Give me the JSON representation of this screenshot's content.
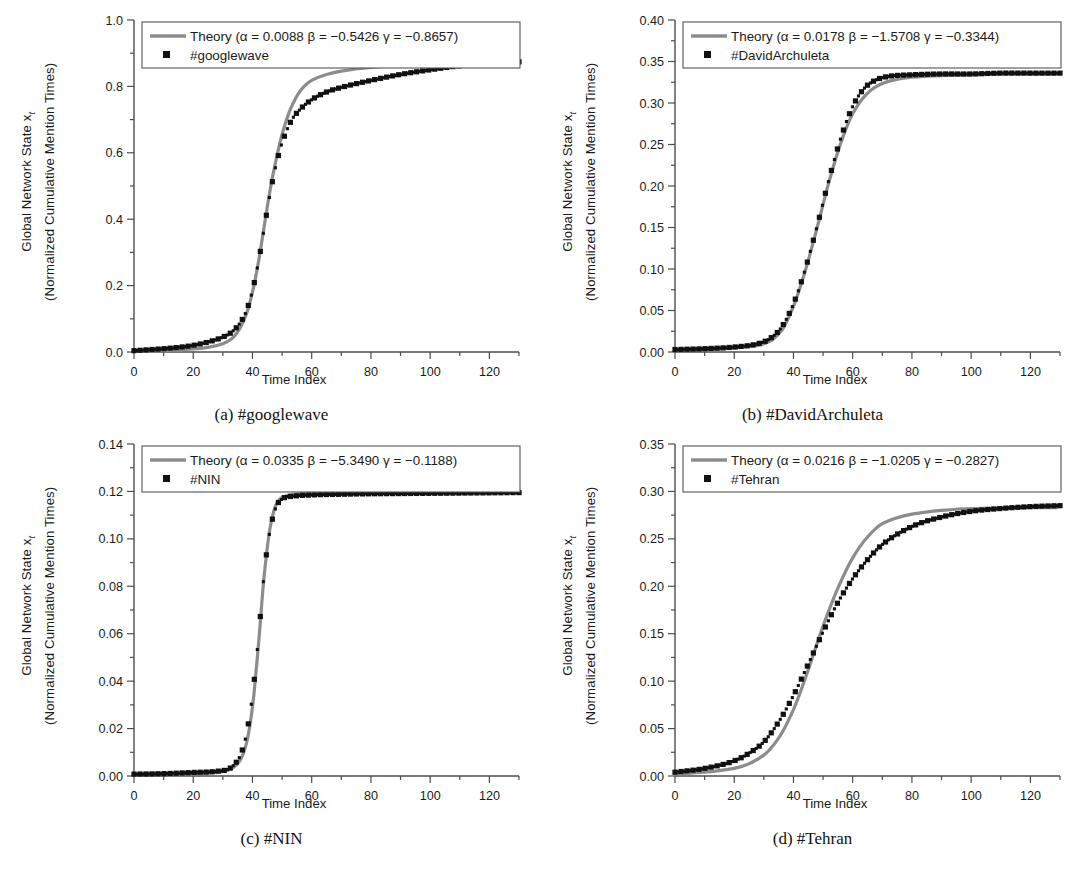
{
  "figure": {
    "axis_labels": {
      "x": "Time Index",
      "y_line1": "Global Network State x",
      "y_sub": "t",
      "y_line2": "(Normalized Cumulative Mention Times)"
    },
    "colors": {
      "theory_line": "#8c8c8c",
      "data_marker": "#111111",
      "axis": "#4d4d4d",
      "legend_border": "#555555",
      "background": "#ffffff"
    }
  },
  "panels": [
    {
      "id": "a",
      "caption": "(a) #googlewave",
      "legend": {
        "theory": "Theory (α = 0.0088 β = −0.5426 γ = −0.8657)",
        "data": "#googlewave",
        "alpha": "0.0088",
        "beta": "−0.5426",
        "gamma": "−0.8657"
      },
      "y_ticks": [
        "0.0",
        "0.2",
        "0.4",
        "0.6",
        "0.8",
        "1.0"
      ],
      "x_ticks": [
        "0",
        "20",
        "40",
        "60",
        "80",
        "100",
        "120"
      ]
    },
    {
      "id": "b",
      "caption": "(b) #DavidArchuleta",
      "legend": {
        "theory": "Theory (α = 0.0178 β = −1.5708 γ = −0.3344)",
        "data": "#DavidArchuleta",
        "alpha": "0.0178",
        "beta": "−1.5708",
        "gamma": "−0.3344"
      },
      "y_ticks": [
        "0.00",
        "0.05",
        "0.10",
        "0.15",
        "0.20",
        "0.25",
        "0.30",
        "0.35",
        "0.40"
      ],
      "x_ticks": [
        "0",
        "20",
        "40",
        "60",
        "80",
        "100",
        "120"
      ]
    },
    {
      "id": "c",
      "caption": "(c) #NIN",
      "legend": {
        "theory": "Theory (α = 0.0335 β = −5.3490 γ = −0.1188)",
        "data": "#NIN",
        "alpha": "0.0335",
        "beta": "−5.3490",
        "gamma": "−0.1188"
      },
      "y_ticks": [
        "0.00",
        "0.02",
        "0.04",
        "0.06",
        "0.08",
        "0.10",
        "0.12",
        "0.14"
      ],
      "x_ticks": [
        "0",
        "20",
        "40",
        "60",
        "80",
        "100",
        "120"
      ]
    },
    {
      "id": "d",
      "caption": "(d) #Tehran",
      "legend": {
        "theory": "Theory (α = 0.0216 β = −1.0205 γ = −0.2827)",
        "data": "#Tehran",
        "alpha": "0.0216",
        "beta": "−1.0205",
        "gamma": "−0.2827"
      },
      "y_ticks": [
        "0.00",
        "0.05",
        "0.10",
        "0.15",
        "0.20",
        "0.25",
        "0.30",
        "0.35"
      ],
      "x_ticks": [
        "0",
        "20",
        "40",
        "60",
        "80",
        "100",
        "120"
      ]
    }
  ],
  "chart_data": [
    {
      "type": "line",
      "panel": "a",
      "title": "(a) #googlewave",
      "xlabel": "Time Index",
      "ylabel": "Global Network State x_t (Normalized Cumulative Mention Times)",
      "xlim": [
        0,
        130
      ],
      "ylim": [
        0.0,
        1.0
      ],
      "xticks": [
        0,
        20,
        40,
        60,
        80,
        100,
        120
      ],
      "yticks": [
        0.0,
        0.2,
        0.4,
        0.6,
        0.8,
        1.0
      ],
      "grid": false,
      "legend_position": "top-left",
      "series": [
        {
          "name": "Theory (α = 0.0088 β = −0.5426 γ = −0.8657)",
          "style": "line",
          "color": "#8c8c8c",
          "params": {
            "alpha": 0.0088,
            "beta": -0.5426,
            "gamma": -0.8657
          },
          "x": [
            0,
            5,
            10,
            15,
            20,
            25,
            30,
            33,
            36,
            38,
            40,
            42,
            44,
            46,
            48,
            50,
            53,
            56,
            60,
            65,
            70,
            80,
            90,
            100,
            110,
            120,
            129
          ],
          "values": [
            0.002,
            0.003,
            0.004,
            0.006,
            0.009,
            0.014,
            0.025,
            0.04,
            0.075,
            0.115,
            0.18,
            0.27,
            0.38,
            0.49,
            0.58,
            0.655,
            0.735,
            0.785,
            0.818,
            0.836,
            0.846,
            0.857,
            0.863,
            0.867,
            0.87,
            0.872,
            0.874
          ]
        },
        {
          "name": "#googlewave",
          "style": "markers",
          "color": "#111111",
          "x": [
            0,
            5,
            10,
            15,
            20,
            25,
            30,
            33,
            36,
            38,
            40,
            42,
            44,
            46,
            48,
            50,
            53,
            56,
            60,
            65,
            70,
            80,
            90,
            100,
            110,
            120,
            129
          ],
          "values": [
            0.004,
            0.007,
            0.01,
            0.014,
            0.02,
            0.03,
            0.045,
            0.06,
            0.09,
            0.125,
            0.185,
            0.27,
            0.375,
            0.48,
            0.565,
            0.63,
            0.695,
            0.73,
            0.76,
            0.783,
            0.797,
            0.818,
            0.836,
            0.85,
            0.862,
            0.87,
            0.874
          ]
        }
      ]
    },
    {
      "type": "line",
      "panel": "b",
      "title": "(b) #DavidArchuleta",
      "xlabel": "Time Index",
      "ylabel": "Global Network State x_t (Normalized Cumulative Mention Times)",
      "xlim": [
        0,
        130
      ],
      "ylim": [
        0.0,
        0.4
      ],
      "xticks": [
        0,
        20,
        40,
        60,
        80,
        100,
        120
      ],
      "yticks": [
        0.0,
        0.05,
        0.1,
        0.15,
        0.2,
        0.25,
        0.3,
        0.35,
        0.4
      ],
      "grid": false,
      "legend_position": "top-left",
      "series": [
        {
          "name": "Theory (α = 0.0178 β = −1.5708 γ = −0.3344)",
          "style": "line",
          "color": "#8c8c8c",
          "params": {
            "alpha": 0.0178,
            "beta": -1.5708,
            "gamma": -0.3344
          },
          "x": [
            0,
            10,
            20,
            28,
            32,
            36,
            40,
            44,
            48,
            52,
            56,
            60,
            64,
            68,
            72,
            80,
            90,
            100,
            110,
            120,
            129
          ],
          "values": [
            0.002,
            0.003,
            0.005,
            0.008,
            0.013,
            0.026,
            0.055,
            0.098,
            0.15,
            0.205,
            0.252,
            0.287,
            0.308,
            0.32,
            0.326,
            0.331,
            0.333,
            0.334,
            0.335,
            0.335,
            0.335
          ]
        },
        {
          "name": "#DavidArchuleta",
          "style": "markers",
          "color": "#111111",
          "x": [
            0,
            10,
            20,
            28,
            32,
            36,
            40,
            44,
            48,
            52,
            56,
            60,
            64,
            68,
            72,
            80,
            90,
            100,
            110,
            120,
            129
          ],
          "values": [
            0.003,
            0.004,
            0.006,
            0.01,
            0.016,
            0.03,
            0.058,
            0.1,
            0.152,
            0.208,
            0.258,
            0.296,
            0.318,
            0.328,
            0.332,
            0.334,
            0.335,
            0.335,
            0.336,
            0.336,
            0.336
          ]
        }
      ]
    },
    {
      "type": "line",
      "panel": "c",
      "title": "(c) #NIN",
      "xlabel": "Time Index",
      "ylabel": "Global Network State x_t (Normalized Cumulative Mention Times)",
      "xlim": [
        0,
        130
      ],
      "ylim": [
        0.0,
        0.14
      ],
      "xticks": [
        0,
        20,
        40,
        60,
        80,
        100,
        120
      ],
      "yticks": [
        0.0,
        0.02,
        0.04,
        0.06,
        0.08,
        0.1,
        0.12,
        0.14
      ],
      "grid": false,
      "legend_position": "top-left",
      "series": [
        {
          "name": "Theory (α = 0.0335 β = −5.3490 γ = −0.1188)",
          "style": "line",
          "color": "#8c8c8c",
          "params": {
            "alpha": 0.0335,
            "beta": -5.349,
            "gamma": -0.1188
          },
          "x": [
            0,
            10,
            20,
            28,
            32,
            34,
            36,
            38,
            40,
            42,
            44,
            46,
            48,
            50,
            54,
            60,
            70,
            80,
            90,
            100,
            110,
            120,
            129
          ],
          "values": [
            0.0005,
            0.0007,
            0.001,
            0.0015,
            0.0025,
            0.004,
            0.007,
            0.014,
            0.029,
            0.055,
            0.085,
            0.105,
            0.1145,
            0.1175,
            0.1188,
            0.1192,
            0.1194,
            0.1195,
            0.1196,
            0.1196,
            0.1197,
            0.1197,
            0.1197
          ]
        },
        {
          "name": "#NIN",
          "style": "markers",
          "color": "#111111",
          "x": [
            0,
            10,
            20,
            28,
            32,
            34,
            36,
            38,
            40,
            42,
            44,
            46,
            48,
            50,
            54,
            60,
            70,
            80,
            90,
            100,
            110,
            120,
            129
          ],
          "values": [
            0.0008,
            0.001,
            0.0015,
            0.002,
            0.003,
            0.005,
            0.009,
            0.018,
            0.034,
            0.058,
            0.086,
            0.104,
            0.1135,
            0.1168,
            0.118,
            0.1185,
            0.1188,
            0.119,
            0.1191,
            0.1192,
            0.1193,
            0.1194,
            0.1195
          ]
        }
      ]
    },
    {
      "type": "line",
      "panel": "d",
      "title": "(d) #Tehran",
      "xlabel": "Time Index",
      "ylabel": "Global Network State x_t (Normalized Cumulative Mention Times)",
      "xlim": [
        0,
        130
      ],
      "ylim": [
        0.0,
        0.35
      ],
      "xticks": [
        0,
        20,
        40,
        60,
        80,
        100,
        120
      ],
      "yticks": [
        0.0,
        0.05,
        0.1,
        0.15,
        0.2,
        0.25,
        0.3,
        0.35
      ],
      "grid": false,
      "legend_position": "top-left",
      "series": [
        {
          "name": "Theory (α = 0.0216 β = −1.0205 γ = −0.2827)",
          "style": "line",
          "color": "#8c8c8c",
          "params": {
            "alpha": 0.0216,
            "beta": -1.0205,
            "gamma": -0.2827
          },
          "x": [
            0,
            10,
            20,
            25,
            30,
            35,
            40,
            45,
            50,
            55,
            60,
            65,
            70,
            80,
            90,
            100,
            110,
            120,
            129
          ],
          "values": [
            0.002,
            0.004,
            0.008,
            0.013,
            0.022,
            0.04,
            0.07,
            0.112,
            0.158,
            0.198,
            0.23,
            0.252,
            0.266,
            0.276,
            0.28,
            0.282,
            0.2825,
            0.283,
            0.283
          ]
        },
        {
          "name": "#Tehran",
          "style": "markers",
          "color": "#111111",
          "x": [
            0,
            10,
            20,
            25,
            30,
            35,
            40,
            45,
            50,
            55,
            60,
            65,
            70,
            80,
            90,
            100,
            110,
            120,
            129
          ],
          "values": [
            0.004,
            0.008,
            0.016,
            0.024,
            0.036,
            0.057,
            0.085,
            0.118,
            0.152,
            0.183,
            0.208,
            0.228,
            0.244,
            0.263,
            0.273,
            0.279,
            0.282,
            0.284,
            0.285
          ]
        }
      ]
    }
  ]
}
